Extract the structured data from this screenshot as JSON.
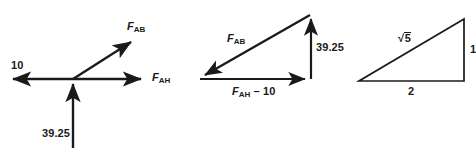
{
  "figure": {
    "background_color": "#ffffff",
    "stroke_color": "#1a1a1a",
    "text_color": "#1a1a1a",
    "width": 476,
    "height": 148
  },
  "diagram1": {
    "name": "free-body-force-diagram",
    "labels": {
      "left_force": "10",
      "diagonal_force_base": "F",
      "diagonal_force_sub": "AB",
      "horizontal_force_base": "F",
      "horizontal_force_sub": "AH",
      "vertical_force": "39.25"
    }
  },
  "diagram2": {
    "name": "force-triangle-diagram",
    "labels": {
      "hypotenuse_base": "F",
      "hypotenuse_sub": "AB",
      "vertical_side": "39.25",
      "horizontal_base": "F",
      "horizontal_sub": "AH",
      "horizontal_operator": " – 10"
    }
  },
  "diagram3": {
    "name": "reference-right-triangle",
    "labels": {
      "hypotenuse_radical": "√",
      "hypotenuse_radicand": "5",
      "vertical_side": "1",
      "horizontal_side": "2"
    }
  }
}
